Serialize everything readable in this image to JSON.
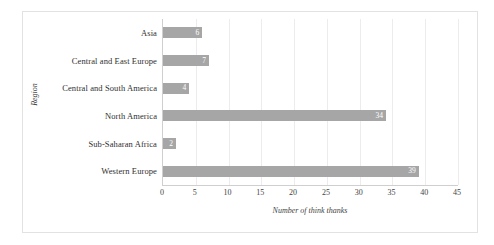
{
  "chart_data": {
    "type": "bar",
    "orientation": "horizontal",
    "title": "",
    "xlabel": "Number of think thanks",
    "ylabel": "Region",
    "categories": [
      "Asia",
      "Central and East Europe",
      "Central and South America",
      "North America",
      "Sub-Saharan Africa",
      "Western Europe"
    ],
    "values": [
      6,
      7,
      4,
      34,
      2,
      39
    ],
    "value_labels": [
      "6",
      "7",
      "4",
      "34",
      "2",
      "39"
    ],
    "xlim": [
      0,
      45
    ],
    "xticks": [
      0,
      5,
      10,
      15,
      20,
      25,
      30,
      35,
      40,
      45
    ],
    "xtick_labels": [
      "0",
      "5",
      "10",
      "15",
      "20",
      "25",
      "30",
      "35",
      "40",
      "45"
    ],
    "grid": "vertical",
    "legend": "none",
    "bar_color": "#a6a6a6",
    "value_label_color": "#ffffff",
    "gridline_color": "#ececec",
    "axis_color": "#cfcfcf",
    "background": "#ffffff",
    "border_color": "#e2e2e2"
  }
}
